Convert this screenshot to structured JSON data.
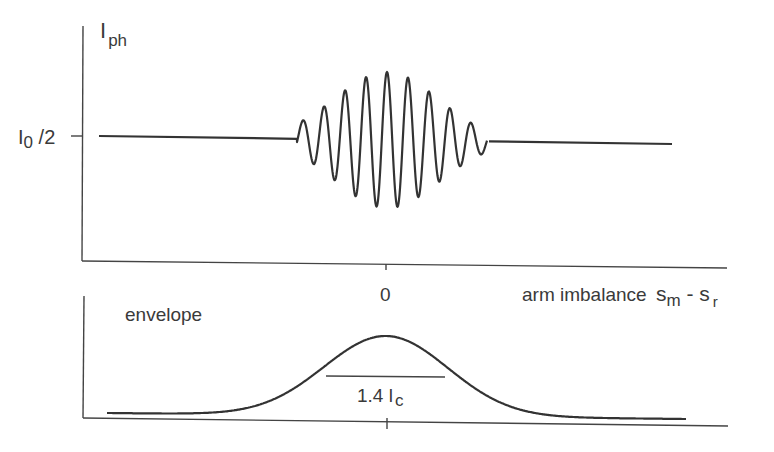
{
  "top_panel": {
    "y_label_main": "I",
    "y_label_sub": "ph",
    "y_tick_label_main": "I",
    "y_tick_label_sub": "0",
    "y_tick_label_rest": " /2",
    "x_tick_label": "0",
    "x_label": "arm imbalance",
    "x_label_s1": "s",
    "x_label_s1_sub": "m",
    "x_label_dash": " - s",
    "x_label_s2_sub": "r"
  },
  "bottom_panel": {
    "title": "envelope",
    "width_label_main": "1.4 l",
    "width_label_sub": "c"
  },
  "chart_data": [
    {
      "type": "line",
      "title": "",
      "ylabel": "I_ph",
      "xlabel": "arm imbalance s_m - s_r",
      "x_ticks": [
        "0"
      ],
      "y_ticks": [
        "I_0 /2"
      ],
      "description": "White-light interferogram: flat at I_0/2, with a Gaussian-modulated fringe packet centered at zero arm imbalance",
      "baseline": "I_0/2",
      "fringe_count_visible": 9,
      "packet_center": 0
    },
    {
      "type": "line",
      "title": "envelope",
      "description": "Gaussian envelope of the fringe packet centered at 0",
      "x_ticks": [
        "0"
      ],
      "annotation": "1.4 l_c",
      "annotation_meaning": "full width at half maximum of envelope"
    }
  ],
  "style": {
    "line_color": "#333333"
  }
}
